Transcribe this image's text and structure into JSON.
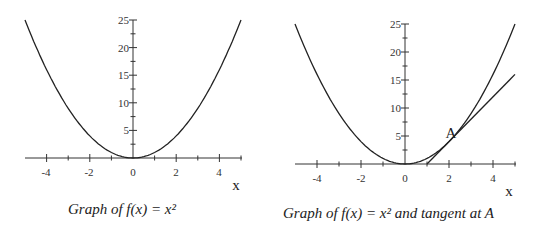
{
  "left": {
    "caption": "Graph of  f(x) = x²",
    "x_label": "x",
    "x_ticks": [
      "-4",
      "-2",
      "0",
      "2",
      "4"
    ],
    "y_ticks": [
      "5",
      "10",
      "15",
      "20",
      "25"
    ]
  },
  "right": {
    "caption": "Graph of  f(x) = x²  and tangent at  A",
    "x_label": "x",
    "point_label": "A",
    "x_ticks": [
      "-4",
      "-2",
      "0",
      "2",
      "4"
    ],
    "y_ticks": [
      "5",
      "10",
      "15",
      "20",
      "25"
    ]
  },
  "chart_data": [
    {
      "type": "line",
      "title": "Graph of f(x) = x^2",
      "xlabel": "x",
      "ylabel": "",
      "xlim": [
        -5,
        5
      ],
      "ylim": [
        0,
        25
      ],
      "series": [
        {
          "name": "f(x) = x^2",
          "function": "x^2",
          "x": [
            -5,
            -4,
            -3,
            -2,
            -1,
            0,
            1,
            2,
            3,
            4,
            5
          ],
          "values": [
            25,
            16,
            9,
            4,
            1,
            0,
            1,
            4,
            9,
            16,
            25
          ]
        }
      ]
    },
    {
      "type": "line",
      "title": "Graph of f(x) = x^2 and tangent at A",
      "xlabel": "x",
      "ylabel": "",
      "xlim": [
        -5,
        5
      ],
      "ylim": [
        0,
        25
      ],
      "annotations": [
        {
          "label": "A",
          "x": 2,
          "y": 4
        }
      ],
      "series": [
        {
          "name": "f(x) = x^2",
          "function": "x^2",
          "x": [
            -5,
            -4,
            -3,
            -2,
            -1,
            0,
            1,
            2,
            3,
            4,
            5
          ],
          "values": [
            25,
            16,
            9,
            4,
            1,
            0,
            1,
            4,
            9,
            16,
            25
          ]
        },
        {
          "name": "tangent at A",
          "function": "4x - 4",
          "x": [
            1,
            2,
            3,
            4,
            5
          ],
          "values": [
            0,
            4,
            8,
            12,
            16
          ]
        }
      ]
    }
  ]
}
